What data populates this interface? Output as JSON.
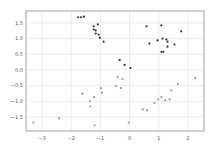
{
  "chart_data": {
    "type": "scatter",
    "title": "",
    "xlabel": "",
    "ylabel": "",
    "xlim": [
      -3.55,
      2.55
    ],
    "ylim": [
      -1.95,
      1.88
    ],
    "grid": true,
    "legend": null,
    "xticks": [
      -3,
      -2,
      -1,
      0,
      1,
      2
    ],
    "xtick_labels": [
      "−3",
      "−2",
      "−1",
      "0",
      "1",
      "2"
    ],
    "yticks": [
      1.5,
      1.0,
      0.5,
      0.0,
      -0.5,
      -1.0,
      -1.5
    ],
    "ytick_labels": [
      "1.5",
      "1.0",
      "0.5",
      "0.0",
      "−0.5",
      "−1.0",
      "−1.5"
    ],
    "series": [
      {
        "name": "class 0",
        "color": "#333333",
        "points": [
          [
            -1.77,
            1.68
          ],
          [
            -1.67,
            1.68
          ],
          [
            -1.57,
            1.7
          ],
          [
            -1.23,
            1.39
          ],
          [
            -1.09,
            1.45
          ],
          [
            -1.23,
            1.29
          ],
          [
            -1.16,
            1.26
          ],
          [
            -1.16,
            1.16
          ],
          [
            -1.06,
            1.13
          ],
          [
            -1.02,
            1.03
          ],
          [
            -0.89,
            0.9
          ],
          [
            0.58,
            1.39
          ],
          [
            1.09,
            1.42
          ],
          [
            1.77,
            1.23
          ],
          [
            0.68,
            0.84
          ],
          [
            0.96,
            0.94
          ],
          [
            1.13,
            1.0
          ],
          [
            1.26,
            0.97
          ],
          [
            1.3,
            0.9
          ],
          [
            1.3,
            0.74
          ],
          [
            1.54,
            0.81
          ],
          [
            1.09,
            0.58
          ],
          [
            1.16,
            0.58
          ],
          [
            -0.34,
            0.32
          ],
          [
            -0.17,
            0.16
          ],
          [
            0.03,
            0.06
          ]
        ]
      },
      {
        "name": "class 1",
        "color": "#999999",
        "points": [
          [
            -3.3,
            -1.68
          ],
          [
            -2.42,
            -1.55
          ],
          [
            -1.62,
            -0.76
          ],
          [
            -1.35,
            -1.0
          ],
          [
            -1.35,
            -1.16
          ],
          [
            -1.22,
            -0.87
          ],
          [
            -0.98,
            -0.58
          ],
          [
            -0.95,
            -0.73
          ],
          [
            -1.2,
            -1.77
          ],
          [
            -0.41,
            -0.23
          ],
          [
            -0.24,
            -0.29
          ],
          [
            -0.48,
            -0.52
          ],
          [
            -0.3,
            -0.58
          ],
          [
            -0.03,
            -1.68
          ],
          [
            0.45,
            -1.26
          ],
          [
            0.6,
            -1.29
          ],
          [
            0.85,
            -1.06
          ],
          [
            0.98,
            -0.94
          ],
          [
            1.09,
            -0.87
          ],
          [
            1.22,
            -0.97
          ],
          [
            1.37,
            -0.94
          ],
          [
            1.43,
            -0.65
          ],
          [
            1.66,
            -0.45
          ],
          [
            2.25,
            -0.26
          ]
        ]
      }
    ]
  }
}
